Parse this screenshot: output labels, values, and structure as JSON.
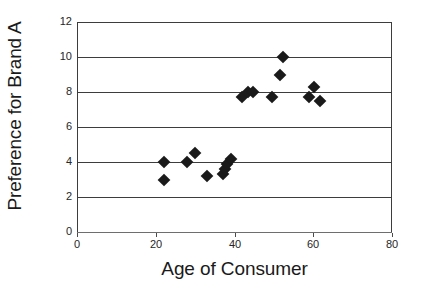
{
  "chart_data": {
    "type": "scatter",
    "title": "",
    "xlabel": "Age of Consumer",
    "ylabel": "Preference for Brand A",
    "xlim": [
      0,
      80
    ],
    "ylim": [
      0,
      12
    ],
    "xticks": [
      0,
      20,
      40,
      60,
      80
    ],
    "yticks": [
      0,
      2,
      4,
      6,
      8,
      10,
      12
    ],
    "xtick_labels": [
      "0",
      "20",
      "40",
      "60",
      "80"
    ],
    "ytick_labels": [
      "0",
      "2",
      "4",
      "6",
      "8",
      "10",
      "12"
    ],
    "grid": "horizontal",
    "legend": null,
    "marker_shape": "diamond",
    "marker_color": "#1a1a1a",
    "series": [
      {
        "name": "Consumers",
        "points": [
          {
            "x": 22,
            "y": 4
          },
          {
            "x": 22,
            "y": 3
          },
          {
            "x": 28,
            "y": 4
          },
          {
            "x": 30,
            "y": 4.5
          },
          {
            "x": 33,
            "y": 3.2
          },
          {
            "x": 37,
            "y": 3.3
          },
          {
            "x": 37.6,
            "y": 3.6
          },
          {
            "x": 38.2,
            "y": 3.9
          },
          {
            "x": 39,
            "y": 4.2
          },
          {
            "x": 42,
            "y": 7.7
          },
          {
            "x": 43.5,
            "y": 8
          },
          {
            "x": 44.6,
            "y": 8
          },
          {
            "x": 49.5,
            "y": 7.7
          },
          {
            "x": 51.6,
            "y": 9
          },
          {
            "x": 52.2,
            "y": 10
          },
          {
            "x": 59,
            "y": 7.7
          },
          {
            "x": 60.2,
            "y": 8.3
          },
          {
            "x": 61.6,
            "y": 7.5
          }
        ]
      }
    ]
  }
}
